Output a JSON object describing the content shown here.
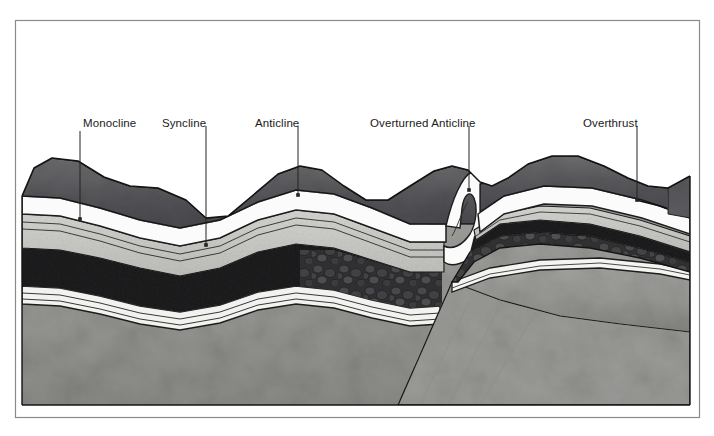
{
  "figure": {
    "kind": "geologic-block-diagram",
    "title_visible": false,
    "frame": {
      "x": 15,
      "y": 20,
      "w": 685,
      "h": 398,
      "stroke": "#8a8a8a"
    },
    "background": "#ffffff"
  },
  "labels": [
    {
      "id": "monocline",
      "text": "Monocline",
      "x": 83,
      "y": 118,
      "leader": {
        "x1": 80,
        "y1": 131,
        "x2": 80,
        "y2": 219
      }
    },
    {
      "id": "syncline",
      "text": "Syncline",
      "x": 162,
      "y": 118,
      "leader": {
        "x1": 206,
        "y1": 126,
        "x2": 206,
        "y2": 245
      }
    },
    {
      "id": "anticline",
      "text": "Anticline",
      "x": 255,
      "y": 118,
      "leader": {
        "x1": 298,
        "y1": 126,
        "x2": 298,
        "y2": 195
      }
    },
    {
      "id": "overturned-anticline",
      "text": "Overturned  Anticline",
      "x": 370,
      "y": 118,
      "leader": {
        "x1": 469,
        "y1": 126,
        "x2": 469,
        "y2": 190
      }
    },
    {
      "id": "overthrust",
      "text": "Overthrust",
      "x": 583,
      "y": 118,
      "leader": {
        "x1": 637,
        "y1": 126,
        "x2": 637,
        "y2": 200
      }
    }
  ],
  "structures": [
    {
      "name": "Monocline",
      "description": "Step-like single flexure in otherwise horizontal strata at left of block"
    },
    {
      "name": "Syncline",
      "description": "Downward-closing fold trough"
    },
    {
      "name": "Anticline",
      "description": "Upward-closing fold arch"
    },
    {
      "name": "Overturned Anticline",
      "description": "Asymmetric fold whose limb has been rotated past vertical"
    },
    {
      "name": "Overthrust",
      "description": "Low-angle reverse fault carrying older strata over younger"
    }
  ],
  "strata": [
    {
      "id": "unit-top-dark",
      "role": "uppermost dark shale / soil cover",
      "color": "#58585a"
    },
    {
      "id": "unit-white-a",
      "role": "white marker bed (limestone)",
      "color": "#fbfbfb"
    },
    {
      "id": "unit-light-gray",
      "role": "light gray sandstone",
      "color": "#c9c9c7"
    },
    {
      "id": "unit-thin-lines",
      "role": "thin banded beds",
      "color": "#d6d6d3"
    },
    {
      "id": "unit-black",
      "role": "dark shale / coal",
      "color": "#1b1b1c"
    },
    {
      "id": "unit-conglomerate",
      "role": "conglomerate with pebbles",
      "color": "#3a3a3b"
    },
    {
      "id": "unit-white-b",
      "role": "lower white marker bed",
      "color": "#f4f4f2"
    },
    {
      "id": "unit-basement",
      "role": "basement / massive gray rock",
      "color": "#9b9b99"
    }
  ],
  "colors": {
    "ink": "#1a1a1a",
    "frame": "#8a8a8a",
    "leader": "#222222",
    "paper": "#ffffff"
  }
}
